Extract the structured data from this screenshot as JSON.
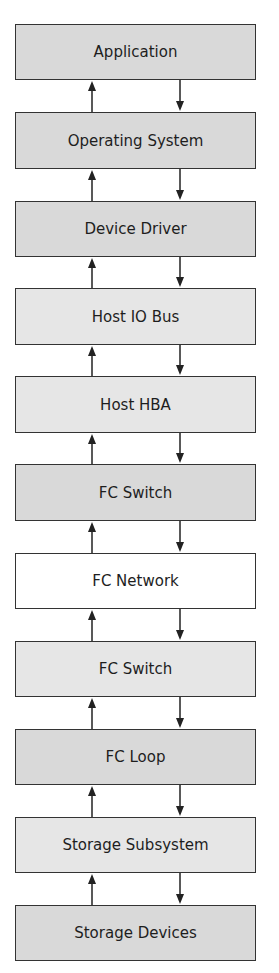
{
  "diagram": {
    "layers": [
      {
        "label": "Application",
        "top": 24,
        "height": 56,
        "shade": "gray"
      },
      {
        "label": "Operating System",
        "top": 112,
        "height": 57,
        "shade": "gray"
      },
      {
        "label": "Device Driver",
        "top": 201,
        "height": 56,
        "shade": "gray"
      },
      {
        "label": "Host IO Bus",
        "top": 288,
        "height": 57,
        "shade": "light"
      },
      {
        "label": "Host HBA",
        "top": 376,
        "height": 57,
        "shade": "light"
      },
      {
        "label": "FC Switch",
        "top": 464,
        "height": 57,
        "shade": "gray"
      },
      {
        "label": "FC Network",
        "top": 553,
        "height": 56,
        "shade": "white"
      },
      {
        "label": "FC Switch",
        "top": 641,
        "height": 56,
        "shade": "light"
      },
      {
        "label": "FC Loop",
        "top": 729,
        "height": 56,
        "shade": "gray"
      },
      {
        "label": "Storage Subsystem",
        "top": 817,
        "height": 56,
        "shade": "light"
      },
      {
        "label": "Storage Devices",
        "top": 905,
        "height": 56,
        "shade": "gray"
      }
    ],
    "arrows": {
      "up_x": 92,
      "down_x": 180,
      "color": "#222222"
    }
  }
}
